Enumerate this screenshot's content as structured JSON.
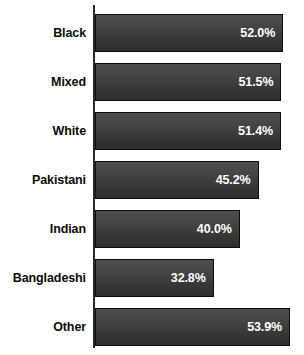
{
  "chart_data": {
    "type": "bar",
    "orientation": "horizontal",
    "title": "",
    "subtitle": "",
    "xlabel": "",
    "ylabel": "",
    "grid": false,
    "legend": null,
    "axis": {
      "value_axis_min": 0,
      "value_axis_max": 53.9,
      "value_suffix": "%",
      "ticks_visible": false
    },
    "categories": [
      "Black",
      "Mixed",
      "White",
      "Pakistani",
      "Indian",
      "Bangladeshi",
      "Other"
    ],
    "values": [
      52.0,
      51.5,
      51.4,
      45.2,
      40.0,
      32.8,
      53.9
    ],
    "labels": [
      "52.0%",
      "51.5%",
      "51.4%",
      "45.2%",
      "40.0%",
      "32.8%",
      "53.9%"
    ],
    "bars": [
      {
        "category": "Black",
        "value": 52.0,
        "label": "52.0%"
      },
      {
        "category": "Mixed",
        "value": 51.5,
        "label": "51.5%"
      },
      {
        "category": "White",
        "value": 51.4,
        "label": "51.4%"
      },
      {
        "category": "Pakistani",
        "value": 45.2,
        "label": "45.2%"
      },
      {
        "category": "Indian",
        "value": 40.0,
        "label": "40.0%"
      },
      {
        "category": "Bangladeshi",
        "value": 32.8,
        "label": "32.8%"
      },
      {
        "category": "Other",
        "value": 53.9,
        "label": "53.9%"
      }
    ],
    "colors": {
      "bar_fill_top": "#4e4e4e",
      "bar_fill_bottom": "#2d2d2d",
      "bar_border": "#0d0d0d",
      "axis": "#2b2b2b",
      "value_text": "#ffffff",
      "category_text": "#0a0a0a",
      "background": "#ffffff"
    }
  }
}
